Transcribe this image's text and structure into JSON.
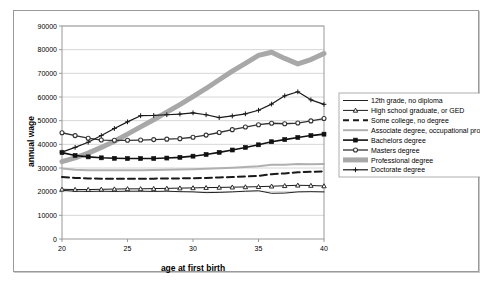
{
  "chart_data": {
    "type": "line",
    "title": "",
    "xlabel": "age at first birth",
    "ylabel": "annual wage",
    "xlim": [
      20,
      40
    ],
    "ylim": [
      0,
      90000
    ],
    "ytick_step": 10000,
    "xticks": [
      20,
      25,
      30,
      35,
      40
    ],
    "xtick_labels": [
      "20",
      "25",
      "30",
      "35",
      "40"
    ],
    "yticks": [
      0,
      10000,
      20000,
      30000,
      40000,
      50000,
      60000,
      70000,
      80000,
      90000
    ],
    "ytick_labels": [
      "0",
      "10000",
      "20000",
      "30000",
      "40000",
      "50000",
      "60000",
      "70000",
      "80000",
      "90000"
    ],
    "grid": "horizontal",
    "legend_position": "right",
    "x": [
      20,
      21,
      22,
      23,
      24,
      25,
      26,
      27,
      28,
      29,
      30,
      31,
      32,
      33,
      34,
      35,
      36,
      37,
      38,
      39,
      40
    ],
    "series": [
      {
        "name": "12th grade, no diploma",
        "color": "#222222",
        "width": 1,
        "dash": "none",
        "marker": "none",
        "values": [
          20600,
          20200,
          20100,
          20200,
          20100,
          20200,
          20200,
          20100,
          20200,
          20000,
          19900,
          19600,
          19700,
          19900,
          20200,
          20400,
          19300,
          19400,
          19900,
          20000,
          19900
        ]
      },
      {
        "name": "High school graduate, or GED",
        "color": "#1a1a1a",
        "width": 1,
        "dash": "none",
        "marker": "triangle",
        "values": [
          21000,
          20900,
          20900,
          21000,
          21100,
          21200,
          21200,
          21300,
          21400,
          21500,
          21600,
          21700,
          21800,
          21900,
          22000,
          22100,
          22300,
          22500,
          22700,
          22600,
          22400
        ]
      },
      {
        "name": "Some college, no degree",
        "color": "#1a1a1a",
        "width": 2,
        "dash": "dashed",
        "marker": "none",
        "values": [
          26200,
          25800,
          25600,
          25500,
          25500,
          25500,
          25500,
          25500,
          25600,
          25600,
          25700,
          25800,
          26000,
          26200,
          26400,
          26700,
          27400,
          27700,
          28200,
          28400,
          28600
        ]
      },
      {
        "name": "Associate degree, occupational program",
        "color": "#b0b0b0",
        "width": 2,
        "dash": "none",
        "marker": "none",
        "values": [
          29800,
          29300,
          29100,
          29100,
          29100,
          29100,
          29100,
          29200,
          29300,
          29400,
          29500,
          29700,
          29900,
          30100,
          30400,
          30700,
          31400,
          31400,
          31700,
          31600,
          31700
        ]
      },
      {
        "name": "Bachelors degree",
        "color": "#111111",
        "width": 1.6,
        "dash": "none",
        "marker": "square",
        "values": [
          36500,
          35300,
          34700,
          34300,
          34100,
          34000,
          34000,
          34000,
          34200,
          34500,
          35000,
          35700,
          36600,
          37600,
          38700,
          39800,
          41100,
          42000,
          42900,
          43700,
          44300
        ]
      },
      {
        "name": "Masters degree",
        "color": "#333333",
        "width": 1.3,
        "dash": "none",
        "marker": "circle",
        "values": [
          44900,
          43700,
          42600,
          41800,
          41700,
          41700,
          41800,
          42000,
          42200,
          42400,
          43000,
          43900,
          45000,
          46200,
          47300,
          48300,
          48900,
          48700,
          49000,
          49900,
          50900
        ]
      },
      {
        "name": "Professional degree",
        "color": "#a8a8a8",
        "width": 5,
        "dash": "none",
        "marker": "none",
        "values": [
          32700,
          34300,
          36300,
          38700,
          41300,
          44300,
          47400,
          50400,
          53600,
          56800,
          60200,
          63600,
          67300,
          70900,
          74200,
          77600,
          78900,
          76300,
          74000,
          75800,
          78400
        ]
      },
      {
        "name": "Doctorate degree",
        "color": "#1a1a1a",
        "width": 1.2,
        "dash": "none",
        "marker": "plus",
        "values": [
          36700,
          38700,
          40900,
          43700,
          46700,
          49500,
          52100,
          52200,
          52500,
          52800,
          53300,
          52500,
          51300,
          52000,
          52900,
          54400,
          57000,
          60500,
          62200,
          58800,
          56900
        ]
      }
    ]
  }
}
